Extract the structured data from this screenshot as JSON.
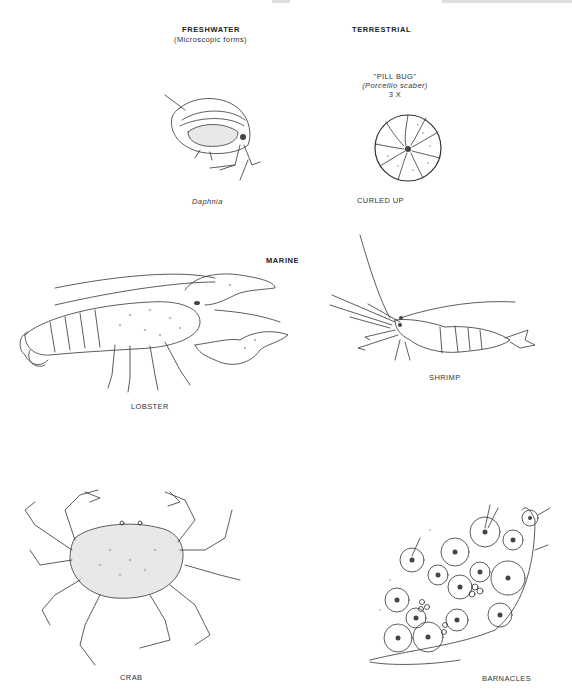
{
  "sections": {
    "freshwater": {
      "title": "FRESHWATER",
      "subtitle": "(Microscopic forms)"
    },
    "terrestrial": {
      "title": "TERRESTRIAL"
    },
    "marine": {
      "title": "MARINE"
    }
  },
  "specimens": {
    "daphnia": {
      "label": "Daphnia"
    },
    "pill_bug": {
      "name": "\"PILL BUG\"",
      "scientific": "(Porcellio scaber)",
      "magnification": "3 X",
      "caption": "CURLED UP"
    },
    "lobster": {
      "label": "LOBSTER"
    },
    "shrimp": {
      "label": "SHRIMP"
    },
    "crab": {
      "label": "CRAB"
    },
    "barnacles": {
      "label": "BARNACLES"
    }
  }
}
